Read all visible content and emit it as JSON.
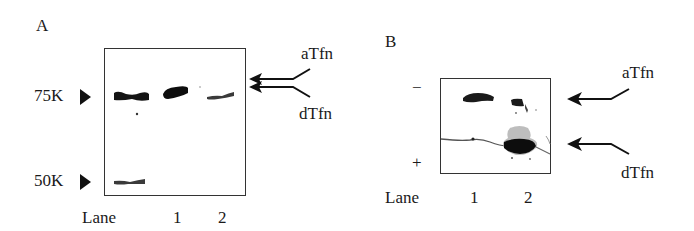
{
  "figure": {
    "panel_a": {
      "letter": "A",
      "markers": [
        {
          "label": "75K",
          "glyph": "▶"
        },
        {
          "label": "50K",
          "glyph": "▶"
        }
      ],
      "lanes": {
        "title": "Lane",
        "labels": [
          "1",
          "2"
        ]
      },
      "arrows": [
        {
          "label": "aTfn"
        },
        {
          "label": "dTfn"
        }
      ]
    },
    "panel_b": {
      "letter": "B",
      "polarity": {
        "top": "−",
        "bottom": "+"
      },
      "lanes": {
        "title": "Lane",
        "labels": [
          "1",
          "2"
        ]
      },
      "arrows": [
        {
          "label": "aTfn"
        },
        {
          "label": "dTfn"
        }
      ]
    }
  }
}
